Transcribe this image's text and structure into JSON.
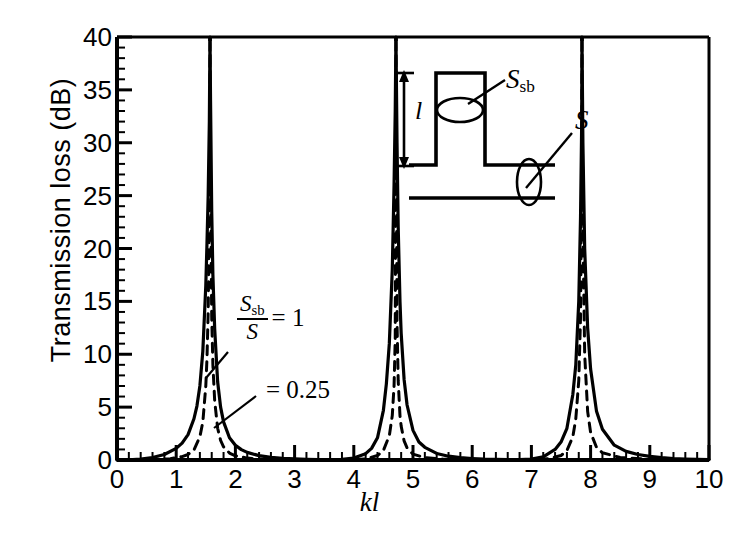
{
  "chart_data": {
    "type": "line",
    "title": "",
    "xlabel": "kl",
    "ylabel": "Transmission loss (dB)",
    "xlim": [
      0,
      10
    ],
    "ylim": [
      0,
      40
    ],
    "xticks": [
      "0",
      "1",
      "2",
      "3",
      "4",
      "5",
      "6",
      "7",
      "8",
      "9",
      "10"
    ],
    "yticks": [
      "0",
      "5",
      "10",
      "15",
      "20",
      "25",
      "30",
      "35",
      "40"
    ],
    "x_minor_step": 0.2,
    "y_minor_step": 1,
    "grid": false,
    "legend_position": "inline-annotation",
    "resonance_peaks_kl": [
      1.571,
      4.712,
      7.854
    ],
    "series": [
      {
        "name": "S_sb/S = 1",
        "style": "solid",
        "area_ratio": 1,
        "annotation": "Ssb/S = 1",
        "x": [
          0.0,
          0.2,
          0.4,
          0.6,
          0.8,
          1.0,
          1.1,
          1.2,
          1.3,
          1.35,
          1.4,
          1.45,
          1.5,
          1.52,
          1.54,
          1.56,
          1.571,
          1.58,
          1.6,
          1.62,
          1.65,
          1.7,
          1.75,
          1.8,
          1.9,
          2.0,
          2.1,
          2.2,
          2.4,
          2.6,
          2.8,
          3.0,
          3.2,
          3.4,
          3.6,
          3.8,
          4.0,
          4.2,
          4.3,
          4.4,
          4.5,
          4.55,
          4.6,
          4.65,
          4.68,
          4.7,
          4.712,
          4.73,
          4.75,
          4.78,
          4.8,
          4.85,
          4.9,
          5.0,
          5.1,
          5.2,
          5.4,
          5.6,
          5.8,
          6.0,
          6.2,
          6.4,
          6.6,
          6.8,
          7.0,
          7.2,
          7.4,
          7.5,
          7.6,
          7.7,
          7.75,
          7.8,
          7.83,
          7.85,
          7.854,
          7.87,
          7.9,
          7.95,
          8.0,
          8.1,
          8.2,
          8.4,
          8.6,
          8.8,
          9.0,
          9.2,
          9.4,
          9.6,
          9.8,
          10.0
        ],
        "y": [
          0.0,
          0.02,
          0.09,
          0.23,
          0.52,
          1.1,
          1.6,
          2.4,
          3.9,
          5.1,
          7.0,
          10.3,
          16.5,
          20.5,
          25.0,
          32.0,
          40.0,
          34.0,
          23.5,
          17.5,
          12.4,
          7.4,
          5.0,
          3.6,
          2.1,
          1.4,
          0.98,
          0.72,
          0.41,
          0.25,
          0.16,
          0.1,
          0.06,
          0.03,
          0.02,
          0.06,
          0.18,
          0.6,
          1.1,
          2.1,
          4.7,
          7.2,
          11.0,
          18.0,
          26.0,
          33.0,
          40.0,
          30.0,
          22.0,
          15.0,
          12.0,
          7.6,
          5.2,
          2.8,
          1.7,
          1.2,
          0.62,
          0.36,
          0.22,
          0.14,
          0.08,
          0.05,
          0.03,
          0.03,
          0.09,
          0.3,
          1.0,
          1.7,
          3.0,
          6.2,
          9.0,
          15.0,
          23.0,
          32.0,
          40.0,
          30.0,
          20.0,
          12.5,
          8.6,
          4.6,
          2.9,
          1.4,
          0.82,
          0.52,
          0.34,
          0.22,
          0.14,
          0.09,
          0.05,
          0.03
        ]
      },
      {
        "name": "S_sb/S = 0.25",
        "style": "dashed",
        "area_ratio": 0.25,
        "annotation": "= 0.25",
        "x": [
          0.0,
          0.3,
          0.6,
          0.9,
          1.1,
          1.2,
          1.3,
          1.4,
          1.45,
          1.5,
          1.52,
          1.54,
          1.56,
          1.571,
          1.58,
          1.6,
          1.62,
          1.65,
          1.7,
          1.75,
          1.8,
          1.9,
          2.0,
          2.2,
          2.5,
          3.0,
          3.5,
          4.0,
          4.2,
          4.4,
          4.5,
          4.6,
          4.65,
          4.68,
          4.7,
          4.712,
          4.73,
          4.75,
          4.78,
          4.8,
          4.85,
          4.9,
          5.0,
          5.2,
          5.5,
          6.0,
          6.5,
          7.0,
          7.3,
          7.5,
          7.6,
          7.7,
          7.75,
          7.8,
          7.83,
          7.85,
          7.854,
          7.87,
          7.9,
          7.95,
          8.0,
          8.1,
          8.2,
          8.5,
          9.0,
          9.5,
          10.0
        ],
        "y": [
          0.0,
          0.01,
          0.04,
          0.13,
          0.32,
          0.52,
          0.95,
          2.2,
          3.6,
          7.0,
          9.6,
          14.0,
          23.0,
          40.0,
          26.0,
          13.5,
          9.0,
          5.6,
          3.0,
          1.85,
          1.25,
          0.66,
          0.4,
          0.18,
          0.07,
          0.02,
          0.004,
          0.03,
          0.1,
          0.42,
          0.9,
          2.3,
          4.2,
          7.0,
          11.5,
          40.0,
          13.0,
          7.5,
          4.2,
          3.2,
          1.8,
          1.15,
          0.55,
          0.22,
          0.09,
          0.02,
          0.005,
          0.02,
          0.13,
          0.42,
          0.9,
          2.2,
          3.9,
          7.5,
          13.5,
          28.0,
          40.0,
          22.0,
          10.0,
          4.6,
          2.6,
          1.2,
          0.68,
          0.24,
          0.07,
          0.02,
          0.01
        ]
      }
    ]
  },
  "annotations": {
    "ratio_numerator": "S",
    "ratio_numerator_sub": "sb",
    "ratio_denominator": "S",
    "ratio_value_1": "= 1",
    "ratio_value_2": "= 0.25"
  },
  "inset": {
    "label_side_branch_area": "S",
    "label_side_branch_area_sub": "sb",
    "label_duct_area": "S",
    "label_length": "l",
    "description": "closed side-branch tube of length l on a main duct"
  }
}
